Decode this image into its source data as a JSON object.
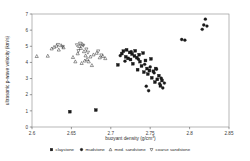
{
  "chart_data": {
    "type": "scatter",
    "title": "",
    "xlabel": "buoyant density (g/cm",
    "xlabel_sup": "3",
    "xlabel_tail": ")",
    "ylabel": "ultrasonic p-wave velocity (km/s)",
    "xlim": [
      2.6,
      2.85
    ],
    "ylim": [
      0,
      7
    ],
    "xticks": [
      "2.6",
      "2.65",
      "2.7",
      "2.75",
      "2.8",
      "2.85"
    ],
    "xtick_values": [
      2.6,
      2.65,
      2.7,
      2.75,
      2.8,
      2.85
    ],
    "yticks": [
      "0",
      "1",
      "2",
      "3",
      "4",
      "5",
      "6",
      "7"
    ],
    "ytick_values": [
      0,
      1,
      2,
      3,
      4,
      5,
      6,
      7
    ],
    "grid": false,
    "legend_position": "below",
    "marker_color": "#1a1a1a",
    "series": [
      {
        "name": "claystone",
        "marker": "square-filled",
        "points": [
          [
            2.709,
            3.85
          ],
          [
            2.714,
            4.55
          ],
          [
            2.716,
            4.7
          ],
          [
            2.719,
            4.35
          ],
          [
            2.72,
            4.78
          ],
          [
            2.722,
            4.25
          ],
          [
            2.724,
            4.62
          ],
          [
            2.725,
            4.18
          ],
          [
            2.727,
            4.52
          ],
          [
            2.728,
            3.92
          ],
          [
            2.73,
            4.4
          ],
          [
            2.731,
            4.72
          ],
          [
            2.733,
            4.3
          ],
          [
            2.734,
            3.55
          ],
          [
            2.736,
            4.48
          ],
          [
            2.737,
            4.05
          ],
          [
            2.739,
            3.78
          ],
          [
            2.741,
            4.58
          ],
          [
            2.742,
            3.4
          ],
          [
            2.744,
            4.12
          ],
          [
            2.746,
            3.62
          ],
          [
            2.747,
            3.28
          ],
          [
            2.749,
            3.5
          ],
          [
            2.751,
            4.22
          ],
          [
            2.752,
            3.05
          ],
          [
            2.754,
            3.45
          ],
          [
            2.756,
            2.78
          ],
          [
            2.757,
            3.62
          ],
          [
            2.759,
            2.95
          ],
          [
            2.761,
            3.18
          ],
          [
            2.763,
            2.55
          ],
          [
            2.765,
            2.88
          ],
          [
            2.648,
            0.95
          ],
          [
            2.681,
            1.05
          ]
        ]
      },
      {
        "name": "mudstone",
        "marker": "circle-filled",
        "points": [
          [
            2.712,
            4.42
          ],
          [
            2.718,
            4.08
          ],
          [
            2.726,
            4.66
          ],
          [
            2.735,
            4.2
          ],
          [
            2.743,
            3.88
          ],
          [
            2.75,
            3.72
          ],
          [
            2.755,
            3.35
          ],
          [
            2.758,
            3.58
          ],
          [
            2.762,
            2.68
          ],
          [
            2.764,
            3.02
          ],
          [
            2.766,
            2.42
          ],
          [
            2.768,
            2.72
          ],
          [
            2.748,
            2.25
          ],
          [
            2.745,
            2.52
          ],
          [
            2.79,
            5.42
          ],
          [
            2.794,
            5.38
          ],
          [
            2.816,
            6.05
          ],
          [
            2.818,
            6.32
          ],
          [
            2.82,
            6.68
          ],
          [
            2.822,
            6.25
          ]
        ]
      },
      {
        "name": "med. sandstone",
        "marker": "triangle-up",
        "points": [
          [
            2.606,
            4.38
          ],
          [
            2.62,
            4.4
          ],
          [
            2.625,
            4.85
          ],
          [
            2.628,
            4.95
          ],
          [
            2.631,
            5.02
          ],
          [
            2.634,
            4.78
          ],
          [
            2.637,
            5.05
          ],
          [
            2.64,
            4.92
          ],
          [
            2.652,
            4.32
          ],
          [
            2.655,
            4.05
          ],
          [
            2.658,
            4.55
          ],
          [
            2.66,
            5.0
          ],
          [
            2.662,
            4.88
          ],
          [
            2.664,
            5.12
          ],
          [
            2.666,
            4.68
          ],
          [
            2.668,
            4.42
          ],
          [
            2.67,
            4.2
          ],
          [
            2.672,
            4.05
          ],
          [
            2.674,
            4.35
          ],
          [
            2.676,
            3.82
          ],
          [
            2.678,
            4.48
          ],
          [
            2.682,
            4.58
          ],
          [
            2.686,
            4.3
          ],
          [
            2.69,
            4.38
          ],
          [
            2.693,
            4.25
          ],
          [
            2.663,
            3.95
          ],
          [
            2.667,
            4.1
          ]
        ]
      },
      {
        "name": "coarse sandstone",
        "marker": "triangle-down",
        "points": [
          [
            2.633,
            5.1
          ],
          [
            2.639,
            4.98
          ],
          [
            2.657,
            5.08
          ],
          [
            2.661,
            5.18
          ],
          [
            2.665,
            5.05
          ],
          [
            2.669,
            4.82
          ],
          [
            2.671,
            4.62
          ],
          [
            2.684,
            4.7
          ],
          [
            2.688,
            4.45
          ],
          [
            2.659,
            4.72
          ]
        ]
      }
    ]
  },
  "legend": {
    "items": [
      {
        "label": "claystone",
        "marker": "square-filled"
      },
      {
        "label": "mudstone",
        "marker": "circle-filled"
      },
      {
        "label": "med. sandstone",
        "marker": "triangle-up"
      },
      {
        "label": "coarse sandstone",
        "marker": "triangle-down"
      }
    ]
  }
}
